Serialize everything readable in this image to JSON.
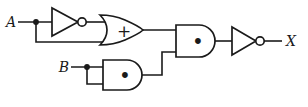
{
  "diagram": {
    "kind": "logic-circuit",
    "colors": {
      "ink": "#1a1a1a",
      "background": "#ffffff"
    },
    "inputs": [
      {
        "id": "A",
        "label": "A"
      },
      {
        "id": "B",
        "label": "B"
      }
    ],
    "output": {
      "id": "X",
      "label": "X"
    },
    "gates": [
      {
        "id": "not-a",
        "type": "NOT",
        "symbol": ""
      },
      {
        "id": "or-1",
        "type": "OR",
        "symbol": "+"
      },
      {
        "id": "and-b",
        "type": "AND",
        "symbol": "•"
      },
      {
        "id": "and-main",
        "type": "AND",
        "symbol": "•"
      },
      {
        "id": "not-output",
        "type": "NOT",
        "symbol": ""
      }
    ]
  }
}
